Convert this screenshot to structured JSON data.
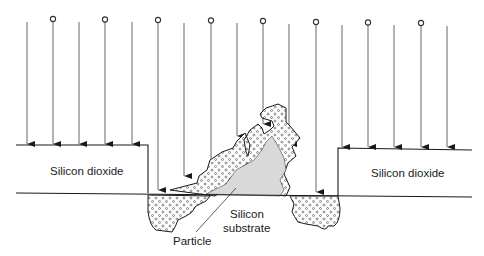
{
  "figure": {
    "type": "cross-section diagram",
    "labels": {
      "oxide_left": "Silicon dioxide",
      "oxide_right": "Silicon dioxide",
      "substrate_line1": "Silicon",
      "substrate_line2": "substrate",
      "particle": "Particle"
    },
    "ion_beam": {
      "arrow_count": 17,
      "ions_marked_with_circles": 8,
      "direction": "downward"
    },
    "colors": {
      "line": "#1a1a1a",
      "beam_line": "#555555",
      "particle_fill": "#d9d9d9",
      "implant_fill": "#ffffff"
    }
  }
}
